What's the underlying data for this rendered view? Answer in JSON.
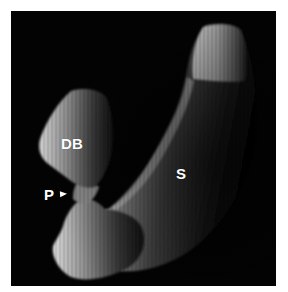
{
  "figure": {
    "background_color": "#030303",
    "frame_color": "#ffffff",
    "labels": {
      "db": "DB",
      "s": "S",
      "p": "P"
    },
    "pointer": {
      "type": "arrowhead",
      "points_to": "narrow constriction between DB and lower body",
      "color": "#ffffff"
    }
  }
}
